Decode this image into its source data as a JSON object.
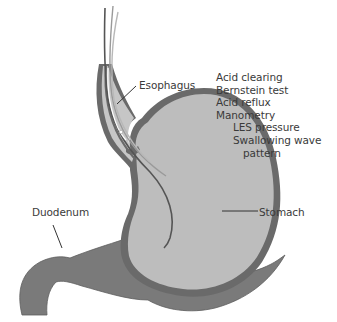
{
  "diagram": {
    "labels": {
      "esophagus": "Esophagus",
      "duodenum": "Duodenum",
      "stomach": "Stomach"
    },
    "tests": {
      "items": [
        {
          "text": "Acid clearing",
          "indent": 0
        },
        {
          "text": "Bernstein test",
          "indent": 0
        },
        {
          "text": "Acid reflux",
          "indent": 0
        },
        {
          "text": "Manometry",
          "indent": 0
        },
        {
          "text": "LES pressure",
          "indent": 1
        },
        {
          "text": "Swallowing wave",
          "indent": 1
        },
        {
          "text": "pattern",
          "indent": 2
        }
      ]
    },
    "colors": {
      "wall": "#6a6a6a",
      "lumen": "#bdbdbd",
      "duodenum_fill": "#7a7a7a",
      "text": "#3a3a3a",
      "background": "#ffffff"
    }
  }
}
